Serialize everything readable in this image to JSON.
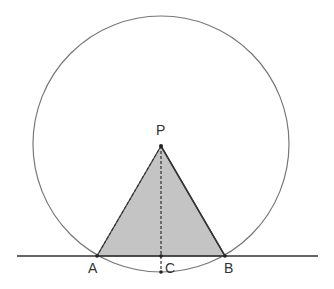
{
  "diagram": {
    "title": "",
    "points": {
      "P": {
        "label": "P",
        "x": 161,
        "y": 146
      },
      "A": {
        "label": "A",
        "x": 97,
        "y": 256
      },
      "B": {
        "label": "B",
        "x": 225,
        "y": 256
      },
      "C": {
        "label": "C",
        "x": 161,
        "y": 256
      },
      "bottom": {
        "x": 161,
        "y": 272
      }
    },
    "circle": {
      "cx": 161,
      "cy": 144,
      "r": 128
    },
    "line": {
      "x1": 17,
      "x2": 318,
      "y": 256
    },
    "colors": {
      "stroke": "#555555",
      "fill": "#bdbdbd",
      "text": "#333333"
    }
  }
}
